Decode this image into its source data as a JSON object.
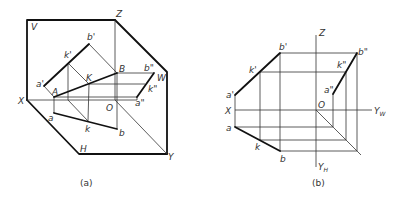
{
  "figures": [
    {
      "id": "a",
      "caption": "(a)",
      "labels": {
        "V": "V",
        "Z": "Z",
        "W": "W",
        "X": "X",
        "O": "O",
        "H": "H",
        "Y": "Y",
        "a_prime": "a'",
        "k_prime": "k'",
        "b_prime": "b'",
        "A": "A",
        "K": "K",
        "B": "B",
        "a": "a",
        "k": "k",
        "b": "b",
        "a_dprime": "a\"",
        "k_dprime": "k\"",
        "b_dprime": "b\""
      }
    },
    {
      "id": "b",
      "caption": "(b)",
      "labels": {
        "Z": "Z",
        "X": "X",
        "O": "O",
        "YW": "Y",
        "YW_sub": "W",
        "YH": "Y",
        "YH_sub": "H",
        "a_prime": "a'",
        "k_prime": "k'",
        "b_prime": "b'",
        "a": "a",
        "k": "k",
        "b": "b",
        "a_dprime": "a\"",
        "k_dprime": "k\"",
        "b_dprime": "b\""
      }
    }
  ]
}
